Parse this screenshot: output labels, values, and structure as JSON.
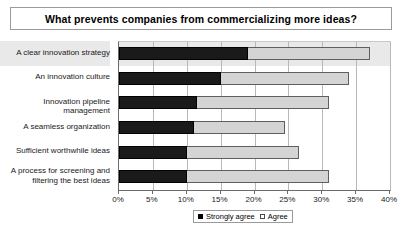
{
  "chart_data": {
    "type": "bar",
    "orientation": "horizontal",
    "stacked": true,
    "title": "What prevents companies from commercializing more ideas?",
    "xlabel": "",
    "ylabel": "",
    "xlim": [
      0,
      40
    ],
    "xticks": [
      "0%",
      "5%",
      "10%",
      "15%",
      "20%",
      "25%",
      "30%",
      "35%",
      "40%"
    ],
    "xtick_values": [
      0,
      5,
      10,
      15,
      20,
      25,
      30,
      35,
      40
    ],
    "grid": true,
    "legend_position": "bottom",
    "categories": [
      "A clear innovation strategy",
      "An innovation culture",
      "Innovation pipeline management",
      "A seamless organization",
      "Sufficient worthwhile ideas",
      "A process for screening and filtering the best ideas"
    ],
    "series": [
      {
        "name": "Strongly agree",
        "color": "#000000",
        "values": [
          19,
          15,
          11.5,
          11,
          10,
          10
        ]
      },
      {
        "name": "Agree",
        "color": "#d4d4d4",
        "values": [
          18,
          19,
          19.5,
          13.5,
          16.5,
          21
        ]
      }
    ],
    "totals": [
      37,
      34,
      31,
      24.5,
      26.5,
      31
    ]
  },
  "legend": {
    "items": [
      {
        "label": "Strongly agree",
        "swatch": "filled-black-square"
      },
      {
        "label": "Agree",
        "swatch": "open-square"
      }
    ]
  }
}
